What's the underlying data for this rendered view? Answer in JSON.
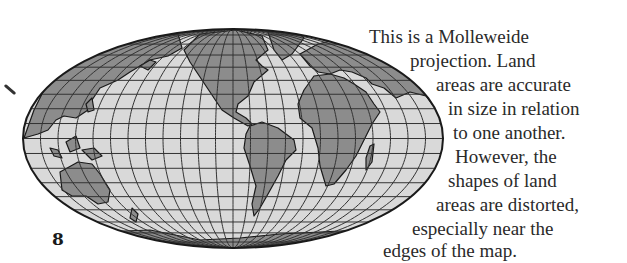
{
  "page": {
    "number": "8",
    "caption_lines": [
      "This is a Molleweide",
      "projection.  Land",
      "areas are accurate",
      "in size in relation",
      "to one another.",
      "However, the",
      "shapes of land",
      "areas are distorted,",
      "especially near the",
      "edges of the map."
    ]
  },
  "map": {
    "projection": "Mollweide",
    "graticule": {
      "parallel_step_deg": 10,
      "meridian_step_deg": 15
    },
    "colors": {
      "ocean": "#d9d9d9",
      "land": "#8c8c8c",
      "outline": "#1a1a1a",
      "grid": "#333333"
    }
  }
}
